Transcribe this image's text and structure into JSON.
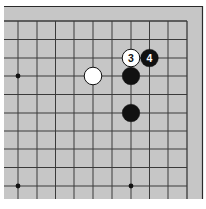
{
  "diagram": {
    "type": "go-board-fragment",
    "board": {
      "background": "#c6c6c6",
      "line_color": "#3a3a3a",
      "frame_color": "#2a2a2a",
      "page_background": "#ffffff",
      "columns": 10,
      "rows": 10,
      "open_edges": [
        "left",
        "bottom"
      ],
      "closed_edges": [
        "top",
        "right"
      ]
    },
    "star_points": [
      {
        "col": 0,
        "row": 3
      },
      {
        "col": 0,
        "row": 9
      },
      {
        "col": 6,
        "row": 9
      }
    ],
    "stones": [
      {
        "color": "white",
        "col": 4,
        "row": 3,
        "label": ""
      },
      {
        "color": "black",
        "col": 6,
        "row": 3,
        "label": ""
      },
      {
        "color": "black",
        "col": 6,
        "row": 5,
        "label": ""
      },
      {
        "color": "white",
        "col": 6,
        "row": 2,
        "label": "3"
      },
      {
        "color": "black",
        "col": 7,
        "row": 2,
        "label": "4"
      }
    ]
  }
}
